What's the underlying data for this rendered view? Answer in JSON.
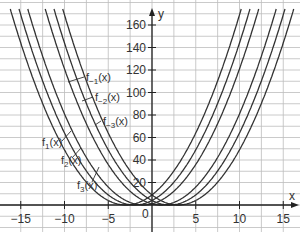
{
  "chart_data": {
    "type": "line",
    "title": "",
    "xlabel": "x",
    "ylabel": "y",
    "xlim": [
      -17,
      17
    ],
    "ylim": [
      -20,
      180
    ],
    "grid": true,
    "x_ticks": [
      -15,
      -10,
      -5,
      0,
      5,
      10,
      15
    ],
    "x_tick_labels": [
      "−15",
      "−10",
      "−5",
      "0",
      "5",
      "10",
      "15"
    ],
    "y_ticks": [
      20,
      40,
      60,
      80,
      100,
      120,
      140,
      160
    ],
    "y_tick_labels": [
      "20",
      "40",
      "60",
      "80",
      "100",
      "120",
      "140",
      "160"
    ],
    "origin_label": "0",
    "series": [
      {
        "name": "f−3(x)",
        "label_base": "f",
        "label_sub": "−3",
        "label_suffix": "(x)",
        "shift": -3
      },
      {
        "name": "f−2(x)",
        "label_base": "f",
        "label_sub": "−2",
        "label_suffix": "(x)",
        "shift": -2
      },
      {
        "name": "f−1(x)",
        "label_base": "f",
        "label_sub": "−1",
        "label_suffix": "(x)",
        "shift": -1
      },
      {
        "name": "f1(x)",
        "label_base": "f",
        "label_sub": "1",
        "label_suffix": "(x)",
        "shift": 1
      },
      {
        "name": "f2(x)",
        "label_base": "f",
        "label_sub": "2",
        "label_suffix": "(x)",
        "shift": 2
      },
      {
        "name": "f3(x)",
        "label_base": "f",
        "label_sub": "3",
        "label_suffix": "(x)",
        "shift": 3
      }
    ],
    "function_form": "y = (x − a)^2"
  }
}
